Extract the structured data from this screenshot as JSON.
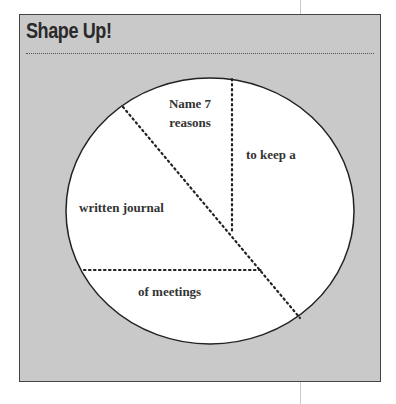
{
  "box": {
    "title": "Shape Up!"
  },
  "puzzle": {
    "segments": [
      {
        "id": "top",
        "line1": "Name 7",
        "line2": "reasons"
      },
      {
        "id": "right",
        "text": "to keep a"
      },
      {
        "id": "left",
        "text": "written journal"
      },
      {
        "id": "bottom",
        "text": "of meetings"
      }
    ]
  },
  "colors": {
    "panel": "#c9c9c9",
    "border": "#444444",
    "circle_fill": "#ffffff",
    "dots": "#222222"
  }
}
